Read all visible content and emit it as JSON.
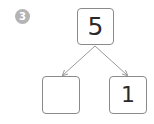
{
  "problem": {
    "number": "3",
    "badge_color": "#b4b4b4"
  },
  "number_bond": {
    "whole": "5",
    "parts": [
      {
        "value": ""
      },
      {
        "value": "1"
      }
    ],
    "line_color": "#9a9a9a",
    "box_border_color": "#8a8a8a"
  }
}
